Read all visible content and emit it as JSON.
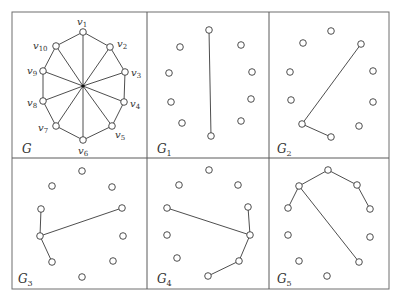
{
  "figure": {
    "frame": {
      "x": 12,
      "y": 12,
      "width": 377,
      "height": 277
    },
    "dividers": {
      "vertical_x": [
        147,
        269
      ],
      "horizontal_y": 158
    },
    "panels": [
      {
        "id": "G",
        "label": "G",
        "label_sub": "",
        "label_pos": [
          22,
          153
        ],
        "hub": [
          83,
          86
        ],
        "nodes": [
          {
            "name": "v1",
            "sub": "1",
            "x": 83,
            "y": 32,
            "lx": 77,
            "ly": 25
          },
          {
            "name": "v2",
            "sub": "2",
            "x": 110,
            "y": 47,
            "lx": 117,
            "ly": 47
          },
          {
            "name": "v3",
            "sub": "3",
            "x": 125,
            "y": 72,
            "lx": 131,
            "ly": 76
          },
          {
            "name": "v4",
            "sub": "4",
            "x": 124,
            "y": 102,
            "lx": 130,
            "ly": 107
          },
          {
            "name": "v5",
            "sub": "5",
            "x": 112,
            "y": 126,
            "lx": 115,
            "ly": 138
          },
          {
            "name": "v6",
            "sub": "6",
            "x": 83,
            "y": 140,
            "lx": 78,
            "ly": 154
          },
          {
            "name": "v7",
            "sub": "7",
            "x": 56,
            "y": 126,
            "lx": 38,
            "ly": 131
          },
          {
            "name": "v8",
            "sub": "8",
            "x": 43,
            "y": 101,
            "lx": 27,
            "ly": 106
          },
          {
            "name": "v9",
            "sub": "9",
            "x": 43,
            "y": 71,
            "lx": 27,
            "ly": 74
          },
          {
            "name": "v10",
            "sub": "10",
            "x": 56,
            "y": 46,
            "lx": 33,
            "ly": 49
          }
        ],
        "description": "Wheel-like graph: 10-cycle v1..v10 with every vertex joined to a central point"
      },
      {
        "id": "G1",
        "label": "G",
        "label_sub": "1",
        "label_pos": [
          157,
          153
        ],
        "nodes": [
          [
            209,
            30
          ],
          [
            180,
            47
          ],
          [
            241,
            45
          ],
          [
            169,
            73
          ],
          [
            252,
            72
          ],
          [
            171,
            102
          ],
          [
            251,
            99
          ],
          [
            182,
            123
          ],
          [
            241,
            121
          ],
          [
            211,
            136
          ]
        ],
        "edges": [
          [
            0,
            9
          ]
        ]
      },
      {
        "id": "G2",
        "label": "G",
        "label_sub": "2",
        "label_pos": [
          277,
          153
        ],
        "nodes": [
          [
            331,
            31
          ],
          [
            303,
            43
          ],
          [
            361,
            44
          ],
          [
            290,
            72
          ],
          [
            373,
            71
          ],
          [
            291,
            100
          ],
          [
            373,
            102
          ],
          [
            302,
            124
          ],
          [
            359,
            126
          ],
          [
            331,
            137
          ]
        ],
        "edges": [
          [
            2,
            7
          ],
          [
            7,
            9
          ]
        ]
      },
      {
        "id": "G3",
        "label": "G",
        "label_sub": "3",
        "label_pos": [
          18,
          283
        ],
        "nodes": [
          [
            82,
            171
          ],
          [
            52,
            186
          ],
          [
            112,
            187
          ],
          [
            41,
            209
          ],
          [
            122,
            208
          ],
          [
            40,
            236
          ],
          [
            123,
            236
          ],
          [
            52,
            262
          ],
          [
            113,
            261
          ],
          [
            82,
            277
          ]
        ],
        "edges": [
          [
            3,
            5
          ],
          [
            5,
            4
          ],
          [
            5,
            7
          ]
        ]
      },
      {
        "id": "G4",
        "label": "G",
        "label_sub": "4",
        "label_pos": [
          157,
          283
        ],
        "nodes": [
          [
            209,
            170
          ],
          [
            179,
            185
          ],
          [
            238,
            185
          ],
          [
            167,
            208
          ],
          [
            248,
            207
          ],
          [
            167,
            235
          ],
          [
            250,
            235
          ],
          [
            177,
            258
          ],
          [
            239,
            261
          ],
          [
            208,
            276
          ]
        ],
        "edges": [
          [
            3,
            6
          ],
          [
            4,
            6
          ],
          [
            6,
            8
          ],
          [
            8,
            9
          ]
        ]
      },
      {
        "id": "G5",
        "label": "G",
        "label_sub": "5",
        "label_pos": [
          277,
          283
        ],
        "nodes": [
          [
            328,
            170
          ],
          [
            299,
            186
          ],
          [
            357,
            185
          ],
          [
            288,
            208
          ],
          [
            370,
            209
          ],
          [
            288,
            235
          ],
          [
            370,
            237
          ],
          [
            299,
            261
          ],
          [
            359,
            262
          ],
          [
            327,
            276
          ]
        ],
        "edges": [
          [
            0,
            1
          ],
          [
            0,
            2
          ],
          [
            2,
            4
          ],
          [
            1,
            3
          ],
          [
            1,
            8
          ]
        ]
      }
    ],
    "colors": {
      "stroke": "#3a3a3a",
      "frame": "#6e6e6e",
      "background": "#ffffff"
    },
    "node_radius": 3.3
  }
}
